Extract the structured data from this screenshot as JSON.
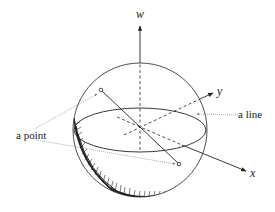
{
  "figure": {
    "type": "sphere-diagram",
    "axes": {
      "w": "w",
      "x": "x",
      "y": "y"
    },
    "annotations": {
      "point": "a point",
      "line": "a line"
    },
    "colors": {
      "stroke": "#222222",
      "background": "#ffffff",
      "leader": "#555555"
    }
  }
}
